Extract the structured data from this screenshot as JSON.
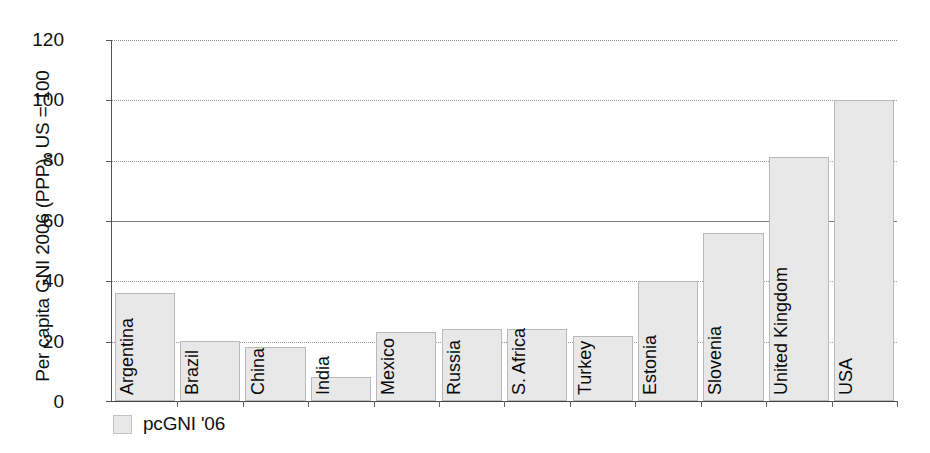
{
  "chart_data": {
    "type": "bar",
    "title": "",
    "subtitle": "",
    "xlabel": "",
    "ylabel": "Per capita GNI 2006 (PPP), US = 100",
    "ylim": [
      0,
      120
    ],
    "yticks": [
      0,
      20,
      40,
      60,
      80,
      100,
      120
    ],
    "ytick_labels": [
      "0",
      "20",
      "40",
      "60",
      "80",
      "100",
      "120"
    ],
    "grid": true,
    "grid_axis": "y",
    "legend": [
      "pcGNI '06"
    ],
    "legend_position": "bottom-left",
    "categories": [
      "Argentina",
      "Brazil",
      "China",
      "India",
      "Mexico",
      "Russia",
      "S. Africa",
      "Turkey",
      "Estonia",
      "Slovenia",
      "United Kingdom",
      "USA"
    ],
    "series": [
      {
        "name": "pcGNI '06",
        "color": "#e8e8e8",
        "values": [
          36,
          20,
          18,
          8,
          23,
          24,
          24,
          21.5,
          40,
          56,
          81,
          100
        ]
      }
    ]
  },
  "legend": {
    "swatch_name": "legend-swatch",
    "label": "pcGNI '06"
  }
}
